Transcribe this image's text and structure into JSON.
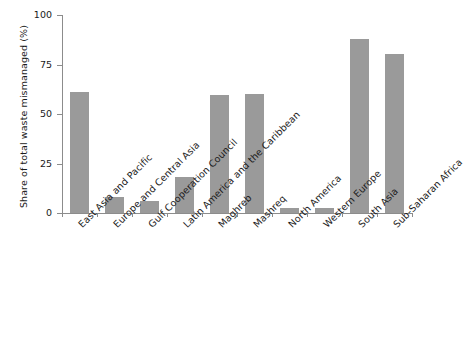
{
  "chart_data": {
    "type": "bar",
    "title": "",
    "xlabel": "",
    "ylabel": "Share of total waste mismanaged (%)",
    "ylim": [
      0,
      100
    ],
    "yticks": [
      0,
      25,
      50,
      75,
      100
    ],
    "ytick_labels": [
      "0",
      "25",
      "50",
      "75",
      "100"
    ],
    "grid": false,
    "legend": false,
    "bar_color": "#9a9a9a",
    "axis_color": "#8c8c8c",
    "text_color": "#1a1a1a",
    "categories": [
      "East Asia and Pacific",
      "Europe and Central Asia",
      "Gulf Cooperation Council",
      "Latin America and the Caribbean",
      "Maghreb",
      "Mashreq",
      "North America",
      "Western Europe",
      "South Asia",
      "Sub-Saharan Africa"
    ],
    "values": [
      61,
      8,
      6,
      18,
      59.5,
      60,
      2.5,
      2.5,
      88,
      80.5
    ]
  }
}
